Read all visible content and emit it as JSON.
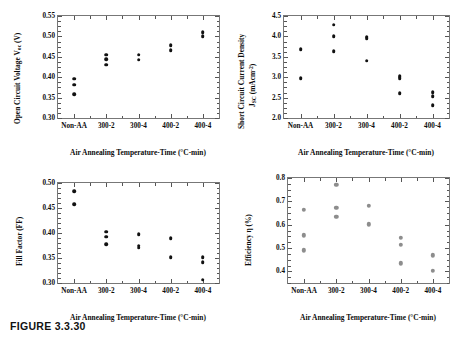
{
  "figure": {
    "caption": "FIGURE 3.3.30",
    "xaxis_title": "Air Annealing Temperature-Time (°C-min)",
    "categories": [
      "Non-AA",
      "300-2",
      "300-4",
      "400-2",
      "400-4"
    ]
  },
  "chart_data": [
    {
      "id": "voc",
      "panel": "top-left",
      "type": "scatter",
      "title": "",
      "ylabel": "Open Circuit Voltage Voc (V)",
      "ylabel_line1": "Open Circuit Voltage V",
      "ylabel_sub": "oc",
      "ylabel_line2": " (V)",
      "xlabel": "Air Annealing Temperature-Time (°C-min)",
      "categories": [
        "Non-AA",
        "300-2",
        "300-4",
        "400-2",
        "400-4"
      ],
      "ylim": [
        0.3,
        0.55
      ],
      "ytick_labels": [
        "0.55",
        "0.50",
        "0.45",
        "0.40",
        "0.35",
        "0.30"
      ],
      "ytick_values": [
        0.55,
        0.5,
        0.45,
        0.4,
        0.35,
        0.3
      ],
      "yminor_step": 0.0125,
      "grid": false,
      "legend": "none",
      "marker_color": "#111111",
      "marker_size_px": 3.6,
      "points": [
        {
          "category": "Non-AA",
          "values": [
            0.396,
            0.382,
            0.359
          ]
        },
        {
          "category": "300-2",
          "values": [
            0.455,
            0.444,
            0.431
          ]
        },
        {
          "category": "300-4",
          "values": [
            0.455,
            0.443
          ]
        },
        {
          "category": "400-2",
          "values": [
            0.478,
            0.466
          ]
        },
        {
          "category": "400-4",
          "values": [
            0.511,
            0.501
          ]
        }
      ]
    },
    {
      "id": "jsc",
      "panel": "top-right",
      "type": "scatter",
      "title": "",
      "ylabel": "Short Circuit Current Density Jsc (mAcm-2)",
      "ylabel_line1": "Short Circuit Current Density",
      "ylabel_line2_pre": "J",
      "ylabel_line2_sub": "SC",
      "ylabel_line2_mid": " (mAcm",
      "ylabel_line2_sup": "-2",
      "ylabel_line2_post": ")",
      "xlabel": "Air Annealing Temperature-Time (°C-min)",
      "categories": [
        "Non-AA",
        "300-2",
        "300-4",
        "400-2",
        "400-4"
      ],
      "ylim": [
        2.0,
        4.5
      ],
      "ytick_labels": [
        "4.5",
        "4.0",
        "3.5",
        "3.0",
        "2.5",
        "2.0"
      ],
      "ytick_values": [
        4.5,
        4.0,
        3.5,
        3.0,
        2.5,
        2.0
      ],
      "yminor_step": 0.125,
      "grid": false,
      "legend": "none",
      "marker_color": "#111111",
      "marker_size_px": 3.6,
      "points": [
        {
          "category": "Non-AA",
          "values": [
            3.68,
            2.98
          ]
        },
        {
          "category": "300-2",
          "values": [
            4.29,
            4.0,
            3.63
          ]
        },
        {
          "category": "300-4",
          "values": [
            3.99,
            3.96,
            3.4
          ]
        },
        {
          "category": "400-2",
          "values": [
            3.02,
            2.97,
            2.61
          ]
        },
        {
          "category": "400-4",
          "values": [
            2.63,
            2.54,
            2.31
          ]
        }
      ]
    },
    {
      "id": "ff",
      "panel": "bottom-left",
      "type": "scatter",
      "title": "",
      "ylabel": "Fill Factor (FF)",
      "xlabel": "Air Annealing Temperature-Time (°C-min)",
      "categories": [
        "Non-AA",
        "300-2",
        "300-4",
        "400-2",
        "400-4"
      ],
      "ylim": [
        0.3,
        0.5
      ],
      "ytick_labels": [
        "0.50",
        "0.45",
        "0.40",
        "0.35",
        "0.30"
      ],
      "ytick_values": [
        0.5,
        0.45,
        0.4,
        0.35,
        0.3
      ],
      "yminor_step": 0.01,
      "grid": false,
      "legend": "none",
      "marker_color": "#111111",
      "marker_size_px": 3.6,
      "points": [
        {
          "category": "Non-AA",
          "values": [
            0.484,
            0.458
          ]
        },
        {
          "category": "300-2",
          "values": [
            0.403,
            0.393,
            0.378
          ]
        },
        {
          "category": "300-4",
          "values": [
            0.398,
            0.375,
            0.371
          ]
        },
        {
          "category": "400-2",
          "values": [
            0.39,
            0.352
          ]
        },
        {
          "category": "400-4",
          "values": [
            0.352,
            0.342,
            0.307
          ]
        }
      ]
    },
    {
      "id": "eff",
      "panel": "bottom-right",
      "type": "scatter",
      "title": "",
      "ylabel": "Efficiency η (%)",
      "xlabel": "Air Annealing Temperature-Time (°C-min)",
      "categories": [
        "Non-AA",
        "300-2",
        "300-4",
        "400-2",
        "400-4"
      ],
      "ylim": [
        0.35,
        0.8
      ],
      "ytick_labels": [
        "0.8",
        "0.7",
        "0.6",
        "0.5",
        "0.4"
      ],
      "ytick_values": [
        0.8,
        0.7,
        0.6,
        0.5,
        0.4
      ],
      "yminor_step": 0.025,
      "grid": false,
      "legend": "none",
      "marker_color": "#8d8d8d",
      "marker_size_px": 4.4,
      "points": [
        {
          "category": "Non-AA",
          "values": [
            0.665,
            0.555,
            0.49
          ]
        },
        {
          "category": "300-2",
          "values": [
            0.77,
            0.672,
            0.633
          ]
        },
        {
          "category": "300-4",
          "values": [
            0.681,
            0.601
          ]
        },
        {
          "category": "400-2",
          "values": [
            0.545,
            0.513,
            0.435
          ]
        },
        {
          "category": "400-4",
          "values": [
            0.468,
            0.402
          ]
        }
      ]
    }
  ]
}
